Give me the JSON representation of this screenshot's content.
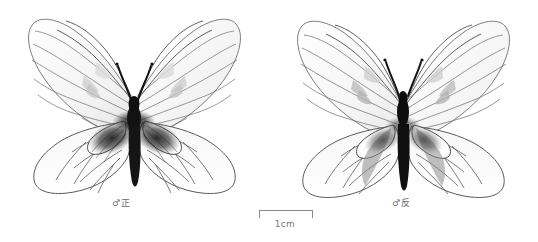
{
  "plate": {
    "background_color": "#ffffff",
    "ink_color": "#3a3a3a",
    "wing_fill": "#fbfbfb",
    "body_color": "#141414",
    "spot_color": "#b9b9b9"
  },
  "specimens": [
    {
      "id": "male-dorsal",
      "caption": "♂正",
      "sex_symbol": "♂",
      "view_label": "正",
      "position": "left"
    },
    {
      "id": "male-ventral",
      "caption": "♂反",
      "sex_symbol": "♂",
      "view_label": "反",
      "position": "right"
    }
  ],
  "scale": {
    "label": "1cm",
    "length_px": 52,
    "unit": "cm",
    "value": 1
  }
}
